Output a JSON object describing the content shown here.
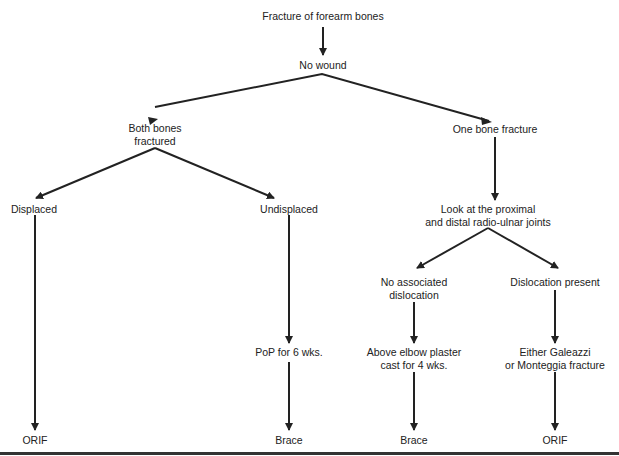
{
  "diagram": {
    "title": "Fracture of forearm bones",
    "nodes": {
      "root": "Fracture of forearm bones",
      "no_wound": "No wound",
      "both_bones_1": "Both bones",
      "both_bones_2": "fractured",
      "one_bone": "One bone fracture",
      "displaced": "Displaced",
      "undisplaced": "Undisplaced",
      "look_1": "Look at the proximal",
      "look_2": "and distal radio-ulnar joints",
      "no_assoc_1": "No associated",
      "no_assoc_2": "dislocation",
      "dislocation_present": "Dislocation present",
      "pop": "PoP for 6 wks.",
      "above_elbow_1": "Above elbow plaster",
      "above_elbow_2": "cast for 4 wks.",
      "either_1": "Either Galeazzi",
      "either_2": "or Monteggia fracture",
      "orif_left": "ORIF",
      "brace_mid": "Brace",
      "brace_right": "Brace",
      "orif_right": "ORIF"
    },
    "line_color": "#222222"
  }
}
